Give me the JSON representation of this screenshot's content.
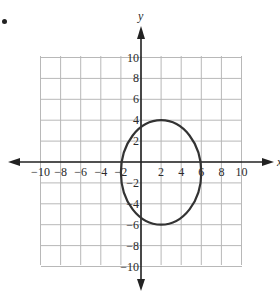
{
  "problem_marker": "•",
  "colors": {
    "grid": "#b8b8b8",
    "axis": "#222222",
    "curve": "#333333",
    "text": "#2a2a2a"
  },
  "chart_data": {
    "type": "line",
    "title": "",
    "xlabel": "x",
    "ylabel": "y",
    "xlim": [
      -10,
      10
    ],
    "ylim": [
      -10,
      10
    ],
    "grid": true,
    "grid_step": 2,
    "x_ticks": [
      -10,
      -8,
      -6,
      -4,
      -2,
      2,
      4,
      6,
      8,
      10
    ],
    "y_ticks": [
      10,
      8,
      6,
      4,
      2,
      -2,
      -4,
      -6,
      -8,
      -10
    ],
    "x_tick_labels": [
      "−10",
      "−8",
      "−6",
      "−4",
      "−2",
      "2",
      "4",
      "6",
      "8",
      "10"
    ],
    "y_tick_labels": [
      "10",
      "8",
      "6",
      "4",
      "2",
      "−2",
      "−4",
      "−6",
      "−8",
      "−10"
    ],
    "series": [
      {
        "name": "ellipse",
        "shape": "ellipse",
        "center": [
          2,
          -1
        ],
        "semi_axis_x": 4,
        "semi_axis_y": 5,
        "points": [
          [
            -2,
            -1
          ],
          [
            2,
            4
          ],
          [
            6,
            -1
          ],
          [
            2,
            -6
          ]
        ]
      }
    ],
    "legend": null
  }
}
